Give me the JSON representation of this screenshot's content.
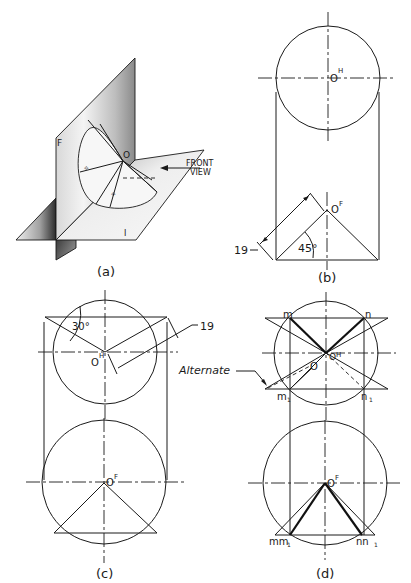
{
  "figure": {
    "panels": [
      {
        "id": "a",
        "caption": "(a)",
        "type": "pictorial",
        "labels": {
          "vertical_plane": "F",
          "horizontal_plane": "H",
          "vertex": "O",
          "view_arrow_line1": "FRONT",
          "view_arrow_line2": "VIEW"
        }
      },
      {
        "id": "b",
        "caption": "(b)",
        "labels": {
          "top_point": "O",
          "top_superscript": "H",
          "front_point": "O",
          "front_superscript": "F",
          "dimension": "19",
          "angle": "45°"
        }
      },
      {
        "id": "c",
        "caption": "(c)",
        "labels": {
          "top_point": "O",
          "top_superscript": "H",
          "front_point": "O",
          "front_superscript": "F",
          "dimension": "19",
          "angle": "30°"
        }
      },
      {
        "id": "d",
        "caption": "(d)",
        "labels": {
          "top_point": "O",
          "top_superscript": "H",
          "front_point": "O",
          "front_superscript": "F",
          "alternate_point": "O",
          "alternate_note": "Alternate",
          "m": "m",
          "n": "n",
          "m1": "m",
          "m1_sub": "1",
          "n1": "n",
          "n1_sub": "1",
          "mm1": "mm",
          "mm1_sub": "1",
          "nn1": "nn",
          "nn1_sub": "1"
        }
      }
    ]
  }
}
